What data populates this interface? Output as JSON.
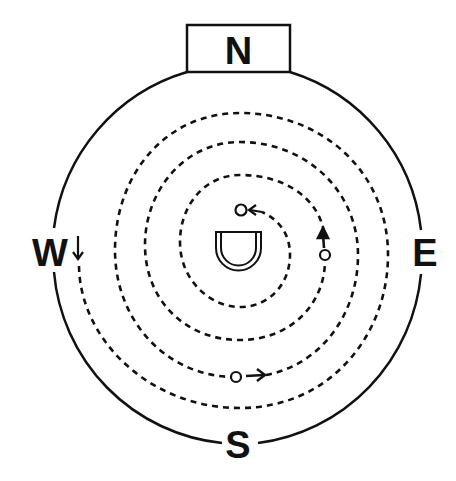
{
  "diagram": {
    "type": "compass-spiral-path",
    "colors": {
      "ink": "#111111",
      "background": "#ffffff"
    },
    "compass": {
      "north": "N",
      "east": "E",
      "south": "S",
      "west": "W"
    },
    "center_symbol": "u-shaped-structure",
    "path": {
      "style": "dashed-spiral",
      "direction": "clockwise-inward",
      "start": "west",
      "end": "center",
      "waypoints": [
        {
          "name": "start-west",
          "marker": "down-arrow"
        },
        {
          "name": "south-node",
          "marker": "circle-right-arrow"
        },
        {
          "name": "east-node",
          "marker": "circle-up-arrow"
        },
        {
          "name": "end-node",
          "marker": "circle-left-arrow"
        }
      ]
    }
  }
}
